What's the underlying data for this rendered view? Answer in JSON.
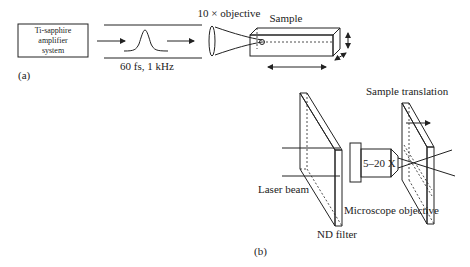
{
  "panel_a": {
    "label": "(a)",
    "source_box": {
      "line1": "Ti-sapphire",
      "line2": "amplifier",
      "line3": "system"
    },
    "pulse_label": "60 fs, 1 kHz",
    "objective_label": "10 × objective",
    "sample_label": "Sample"
  },
  "panel_b": {
    "label": "(b)",
    "sample_translation_label": "Sample translation",
    "magnification_label": "5–20 X",
    "laser_beam_label": "Laser beam",
    "microscope_objective_label": "Microscope objective",
    "nd_filter_label": "ND filter"
  },
  "colors": {
    "line": "#222222",
    "background": "#ffffff"
  }
}
